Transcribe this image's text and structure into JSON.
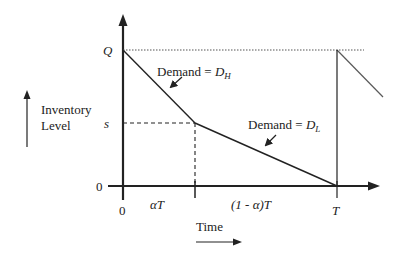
{
  "diagram": {
    "type": "inventory-level-vs-time",
    "y_axis": {
      "label_line1": "Inventory",
      "label_line2": "Level",
      "ticks": [
        {
          "label": "Q",
          "meaning": "order quantity / max level"
        },
        {
          "label": "s",
          "meaning": "switch level"
        },
        {
          "label": "0",
          "meaning": "zero level"
        }
      ]
    },
    "x_axis": {
      "label": "Time",
      "ticks": [
        {
          "label": "0"
        },
        {
          "label": "T"
        }
      ],
      "intervals": [
        {
          "label": "αT"
        },
        {
          "label": "(1 - α)T"
        }
      ]
    },
    "annotations": [
      {
        "text_prefix": "Demand = ",
        "symbol": "D",
        "subscript": "H"
      },
      {
        "text_prefix": "Demand = ",
        "symbol": "D",
        "subscript": "L"
      }
    ],
    "colors": {
      "line": "#222222",
      "dotted": "#555555",
      "faded": "#888888"
    }
  }
}
